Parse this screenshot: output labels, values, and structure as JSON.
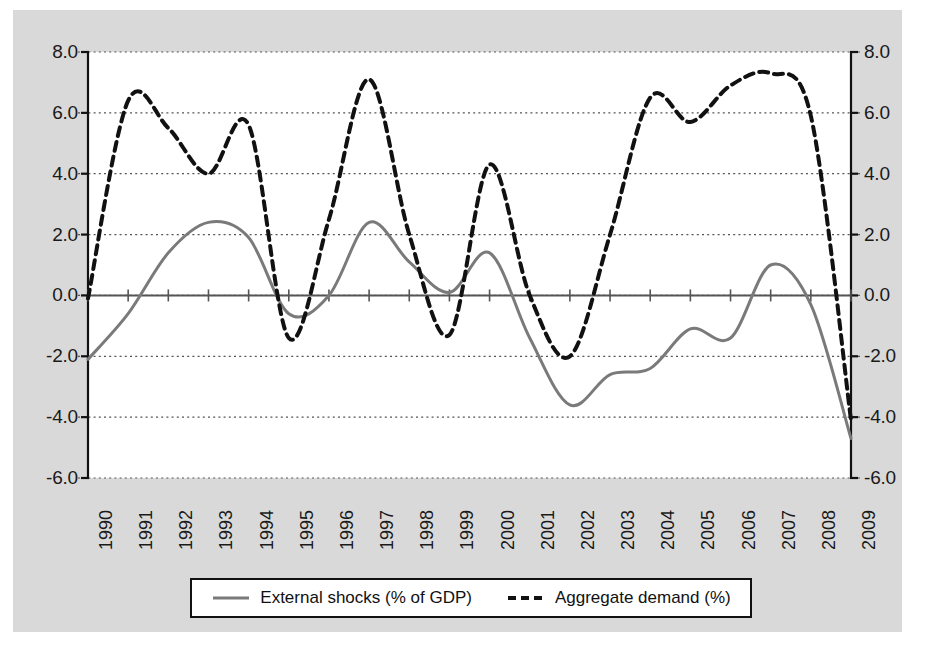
{
  "chart_data": {
    "type": "line",
    "title": "",
    "subtitle": "",
    "xlabel": "",
    "ylabel": "",
    "ylim": [
      -6.0,
      8.0
    ],
    "ytick_values": [
      8.0,
      6.0,
      4.0,
      2.0,
      0.0,
      -2.0,
      -4.0,
      -6.0
    ],
    "ytick_labels_left": [
      "8.0",
      "6.0",
      "4.0",
      "2.0",
      "0.0",
      "-2.0",
      "-4.0",
      "-6.0"
    ],
    "ytick_labels_right": [
      "8.0",
      "6.0",
      "4.0",
      "2.0",
      "0.0",
      "-2.0",
      "-4.0",
      "-6.0"
    ],
    "dual_axis": true,
    "grid": "horizontal-dotted",
    "legend_position": "bottom",
    "categories": [
      "1990",
      "1991",
      "1992",
      "1993",
      "1994",
      "1995",
      "1996",
      "1997",
      "1998",
      "1999",
      "2000",
      "2001",
      "2002",
      "2003",
      "2004",
      "2005",
      "2006",
      "2007",
      "2008",
      "2009"
    ],
    "x": [
      1990,
      1991,
      1992,
      1993,
      1994,
      1995,
      1996,
      1997,
      1998,
      1999,
      2000,
      2001,
      2002,
      2003,
      2004,
      2005,
      2006,
      2007,
      2008,
      2009
    ],
    "series": [
      {
        "name": "External shocks (% of GDP)",
        "style": "solid",
        "color": "#7a7a7a",
        "width": 3,
        "values": [
          -2.1,
          -0.6,
          1.4,
          2.4,
          1.9,
          -0.6,
          0.0,
          2.4,
          1.1,
          0.1,
          1.4,
          -1.4,
          -3.6,
          -2.6,
          -2.4,
          -1.1,
          -1.4,
          1.0,
          -0.3,
          -4.7
        ]
      },
      {
        "name": "Aggregate demand (%)",
        "style": "dashed",
        "color": "#111111",
        "width": 4,
        "values": [
          -0.1,
          6.4,
          5.5,
          4.0,
          5.6,
          -1.4,
          2.5,
          7.1,
          2.0,
          -1.3,
          4.3,
          0.0,
          -2.0,
          2.0,
          6.5,
          5.7,
          6.9,
          7.3,
          5.9,
          -4.1
        ]
      }
    ]
  },
  "legend": {
    "entries": [
      {
        "label": "External shocks (% of GDP)",
        "marker": "solid-line-swatch"
      },
      {
        "label": "Aggregate demand (%)",
        "marker": "dashed-line-swatch"
      }
    ]
  },
  "colors": {
    "panel_background": "#d9d9d9",
    "plot_background": "#ffffff",
    "axis": "#111111",
    "grid": "#555555",
    "series_solid": "#7a7a7a",
    "series_dashed": "#111111",
    "text": "#1a1a1a"
  }
}
